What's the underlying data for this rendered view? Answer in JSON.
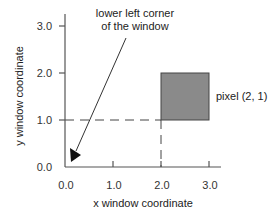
{
  "figure": {
    "x_axis_label": "x window coordinate",
    "y_axis_label": "y window coordinate",
    "x_ticks": [
      "0.0",
      "1.0",
      "2.0",
      "3.0"
    ],
    "y_ticks": [
      "0.0",
      "1.0",
      "2.0",
      "3.0"
    ],
    "annotation_line1": "lower left corner",
    "annotation_line2": "of the window",
    "pixel_label": "pixel (2, 1)",
    "colors": {
      "axis": "#555555",
      "pixel_fill": "#8a8a8a",
      "pixel_border": "#444444",
      "dash": "#444444",
      "arrow": "#333333"
    }
  }
}
